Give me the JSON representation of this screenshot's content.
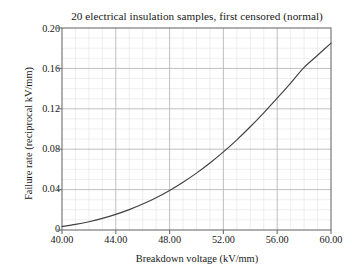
{
  "chart_data": {
    "type": "line",
    "title": "20 electrical insulation samples, first censored (normal)",
    "xlabel": "Breakdown voltage (kV/mm)",
    "ylabel": "Failure rate (reciprocal kV/mm)",
    "xlim": [
      40.0,
      60.0
    ],
    "ylim": [
      0.0,
      0.2
    ],
    "xticks": [
      40.0,
      44.0,
      48.0,
      52.0,
      56.0,
      60.0
    ],
    "xtick_labels": [
      "40.00",
      "44.00",
      "48.00",
      "52.00",
      "56.00",
      "60.00"
    ],
    "yticks": [
      0.0,
      0.04,
      0.08,
      0.12,
      0.16,
      0.2
    ],
    "ytick_labels": [
      "0",
      "0.04",
      "0.08",
      "0.12",
      "0.16",
      "0.20"
    ],
    "grid": true,
    "minor_grid": true,
    "minor_divisions": 4,
    "legend": null,
    "line_color": "#404040",
    "grid_color": "#b5b5b5",
    "minor_grid_color": "#e3e3e3",
    "axis_color": "#6e6e6e",
    "background": "#ffffff",
    "series": [
      {
        "name": "hazard rate",
        "x": [
          40.0,
          41.0,
          42.0,
          43.0,
          44.0,
          45.0,
          46.0,
          47.0,
          48.0,
          49.0,
          50.0,
          51.0,
          52.0,
          53.0,
          54.0,
          55.0,
          56.0,
          57.0,
          58.0,
          59.0,
          60.0
        ],
        "y": [
          0.0035,
          0.0055,
          0.0082,
          0.0115,
          0.0155,
          0.0202,
          0.0257,
          0.032,
          0.0392,
          0.0473,
          0.0563,
          0.0663,
          0.0773,
          0.0893,
          0.1022,
          0.116,
          0.1305,
          0.1455,
          0.161,
          0.173,
          0.185
        ]
      }
    ]
  }
}
